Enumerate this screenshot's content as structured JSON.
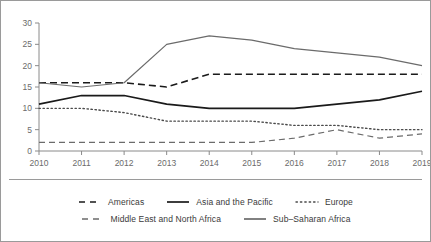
{
  "chart_data": {
    "type": "line",
    "title": "",
    "subtitle": "",
    "xlabel": "",
    "ylabel": "",
    "x": [
      2010,
      2011,
      2012,
      2013,
      2014,
      2015,
      2016,
      2017,
      2018,
      2019
    ],
    "categories": [
      "2010",
      "2011",
      "2012",
      "2013",
      "2014",
      "2015",
      "2016",
      "2017",
      "2018",
      "2019"
    ],
    "xlim": [
      2010,
      2019
    ],
    "ylim": [
      0,
      30
    ],
    "yticks": [
      0,
      5,
      10,
      15,
      20,
      25,
      30
    ],
    "ytick_labels": [
      "0",
      "5",
      "10",
      "15",
      "20",
      "25",
      "30"
    ],
    "grid": false,
    "legend_position": "bottom",
    "series": [
      {
        "name": "Americas",
        "style": "dashed",
        "color": "#1a1a1a",
        "width": 1.6,
        "values": [
          16,
          16,
          16,
          15,
          18,
          18,
          18,
          18,
          18,
          18
        ]
      },
      {
        "name": "Asia and the Pacific",
        "style": "solid",
        "color": "#1a1a1a",
        "width": 1.7,
        "values": [
          11,
          13,
          13,
          11,
          10,
          10,
          10,
          11,
          12,
          14
        ]
      },
      {
        "name": "Europe",
        "style": "dotted",
        "color": "#4a4a4a",
        "width": 1.4,
        "values": [
          10,
          10,
          9,
          7,
          7,
          7,
          6,
          6,
          5,
          5
        ]
      },
      {
        "name": "Middle East and North Africa",
        "style": "dashed",
        "color": "#6b6b6b",
        "width": 1.2,
        "values": [
          2,
          2,
          2,
          2,
          2,
          2,
          3,
          5,
          3,
          4
        ]
      },
      {
        "name": "Sub–Saharan Africa",
        "style": "solid",
        "color": "#6b6b6b",
        "width": 1.2,
        "values": [
          16,
          15,
          16,
          25,
          27,
          26,
          24,
          23,
          22,
          20
        ]
      }
    ]
  },
  "axes": {
    "y_ticks": [
      "30",
      "25",
      "20",
      "15",
      "10",
      "5",
      "0"
    ],
    "x_ticks": [
      "2010",
      "2011",
      "2012",
      "2013",
      "2014",
      "2015",
      "2016",
      "2017",
      "2018",
      "2019"
    ]
  },
  "legend": {
    "rows": [
      [
        {
          "label": "Americas",
          "style": "dashed",
          "color": "#1a1a1a"
        },
        {
          "label": "Asia and the Pacific",
          "style": "solid",
          "color": "#1a1a1a"
        },
        {
          "label": "Europe",
          "style": "dotted",
          "color": "#4a4a4a"
        }
      ],
      [
        {
          "label": "Middle East and North Africa",
          "style": "dashed",
          "color": "#6b6b6b"
        },
        {
          "label": "Sub–Saharan Africa",
          "style": "solid",
          "color": "#6b6b6b"
        }
      ]
    ]
  },
  "colors": {
    "frame": "#9a9a9a",
    "axis": "#8a8a8a",
    "tick_text": "#6b6b6b",
    "legend_text": "#3a3a3a",
    "background": "#ffffff"
  }
}
